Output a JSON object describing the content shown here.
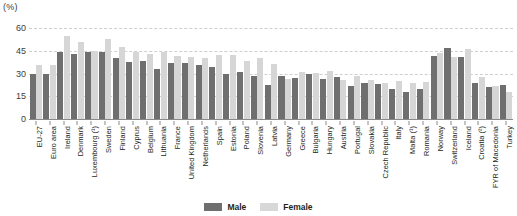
{
  "chart_data": {
    "type": "bar",
    "title": "",
    "subtitle": "",
    "unit_label": "(%)",
    "xlabel": "",
    "ylabel": "",
    "ylim": [
      0,
      60
    ],
    "yticks": [
      0,
      15,
      30,
      45,
      60
    ],
    "grid": true,
    "legend_position": "bottom-center",
    "categories": [
      "EU-27",
      "Euro area",
      "Ireland",
      "Denmark",
      "Luxembourg (¹)",
      "Sweden",
      "Finland",
      "Cyprus",
      "Belgium",
      "Lithuania",
      "France",
      "United Kingdom",
      "Netherlands",
      "Spain",
      "Estonia",
      "Poland",
      "Slovenia",
      "Latvia",
      "Germany",
      "Greece",
      "Bulgaria",
      "Hungary",
      "Austria",
      "Portugal",
      "Slovakia",
      "Czech Republic",
      "Italy",
      "Malta (¹)",
      "Romania",
      "Norway",
      "Switzerland",
      "Iceland",
      "Croatia (²)",
      "FYR of Macedonia",
      "Turkey"
    ],
    "series": [
      {
        "name": "Male",
        "color": "#6f6f6f",
        "values": [
          29.5,
          29.5,
          44.5,
          43.0,
          44.5,
          44.5,
          40.0,
          37.5,
          38.5,
          33.0,
          37.0,
          37.0,
          35.5,
          34.5,
          30.0,
          31.0,
          28.5,
          22.5,
          28.5,
          27.0,
          30.0,
          26.5,
          28.0,
          22.0,
          23.5,
          23.0,
          20.0,
          18.0,
          19.5,
          41.5,
          46.5,
          41.0,
          24.0,
          21.0,
          22.5
        ]
      },
      {
        "name": "Female",
        "color": "#d6d6d6",
        "values": [
          35.5,
          35.5,
          55.0,
          51.0,
          45.0,
          53.0,
          47.5,
          44.0,
          43.0,
          44.5,
          41.5,
          41.0,
          40.5,
          42.0,
          42.5,
          38.0,
          40.5,
          36.5,
          26.5,
          31.0,
          30.5,
          31.5,
          26.0,
          28.5,
          26.0,
          23.5,
          25.0,
          24.0,
          24.5,
          43.5,
          41.0,
          46.0,
          28.0,
          21.5,
          18.0
        ]
      }
    ]
  },
  "legend": {
    "items": [
      {
        "label": "Male",
        "color": "#6f6f6f"
      },
      {
        "label": "Female",
        "color": "#d8d8d8"
      }
    ]
  }
}
